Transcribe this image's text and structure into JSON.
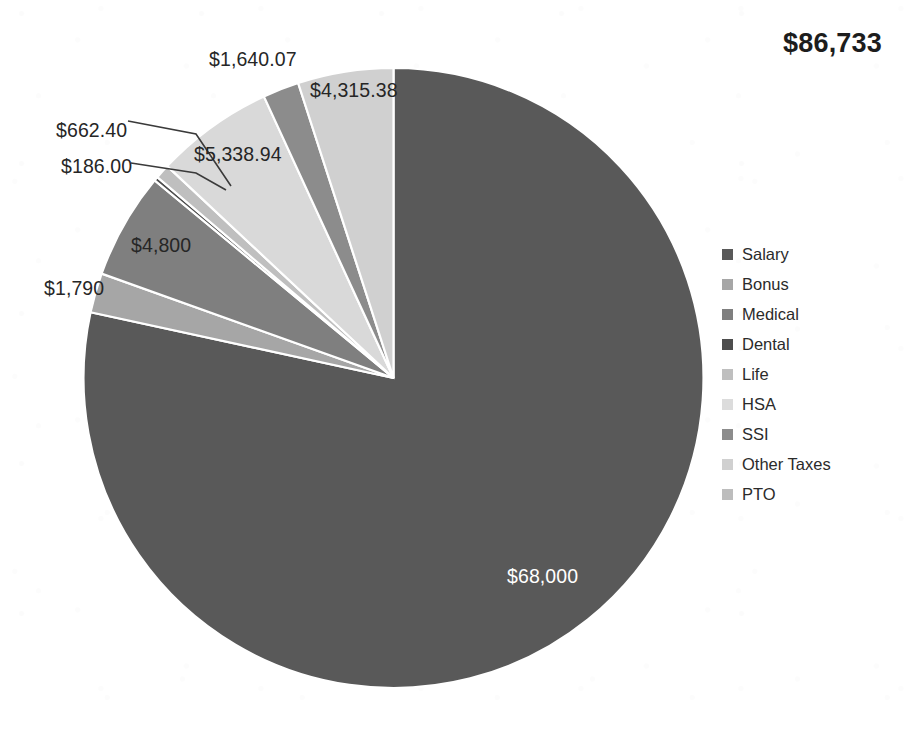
{
  "total": {
    "label": "$86,733"
  },
  "chart_data": {
    "type": "pie",
    "title": "",
    "total": 86733,
    "total_label": "$86,733",
    "legend_position": "right",
    "grid": false,
    "start_angle_deg": 0,
    "direction": "clockwise",
    "categories": [
      "Salary",
      "Bonus",
      "Medical",
      "Dental",
      "Life",
      "HSA",
      "SSI",
      "Other Taxes",
      "PTO"
    ],
    "values": [
      68000,
      1790,
      4800,
      186.0,
      662.4,
      5338.94,
      1640.07,
      4315.38,
      0
    ],
    "slices": [
      {
        "name": "Salary",
        "label": "$68,000",
        "value": 68000,
        "color": "#595959",
        "label_color": "#ffffff",
        "leader": false
      },
      {
        "name": "Bonus",
        "label": "$1,790",
        "value": 1790,
        "color": "#a6a6a6",
        "label_color": "#262626",
        "leader": false
      },
      {
        "name": "Medical",
        "label": "$4,800",
        "value": 4800,
        "color": "#7f7f7f",
        "label_color": "#262626",
        "leader": false
      },
      {
        "name": "Dental",
        "label": "$186.00",
        "value": 186.0,
        "color": "#4d4d4d",
        "label_color": "#262626",
        "leader": true
      },
      {
        "name": "Life",
        "label": "$662.40",
        "value": 662.4,
        "color": "#bfbfbf",
        "label_color": "#262626",
        "leader": true
      },
      {
        "name": "HSA",
        "label": "$5,338.94",
        "value": 5338.94,
        "color": "#d9d9d9",
        "label_color": "#262626",
        "leader": false
      },
      {
        "name": "SSI",
        "label": "$1,640.07",
        "value": 1640.07,
        "color": "#8c8c8c",
        "label_color": "#262626",
        "leader": false
      },
      {
        "name": "Other Taxes",
        "label": "$4,315.38",
        "value": 4315.38,
        "color": "#d0d0d0",
        "label_color": "#262626",
        "leader": false
      },
      {
        "name": "PTO",
        "label": "",
        "value": 0,
        "color": "#bdbdbd",
        "label_color": "#262626",
        "leader": false
      }
    ],
    "data_labels": [
      {
        "text": "$1,640.07",
        "x": 209,
        "y": 48,
        "color": "dark"
      },
      {
        "text": "$4,315.38",
        "x": 310,
        "y": 79,
        "color": "dark"
      },
      {
        "text": "$662.40",
        "x": 56,
        "y": 119,
        "color": "dark"
      },
      {
        "text": "$5,338.94",
        "x": 194,
        "y": 143,
        "color": "dark"
      },
      {
        "text": "$186.00",
        "x": 61,
        "y": 155,
        "color": "dark"
      },
      {
        "text": "$4,800",
        "x": 131,
        "y": 234,
        "color": "dark"
      },
      {
        "text": "$1,790",
        "x": 44,
        "y": 277,
        "color": "dark"
      },
      {
        "text": "$68,000",
        "x": 507,
        "y": 565,
        "color": "white"
      }
    ]
  },
  "legend": {
    "items": [
      {
        "label": "Salary",
        "color": "#595959"
      },
      {
        "label": "Bonus",
        "color": "#a6a6a6"
      },
      {
        "label": "Medical",
        "color": "#7f7f7f"
      },
      {
        "label": "Dental",
        "color": "#4d4d4d"
      },
      {
        "label": "Life",
        "color": "#bfbfbf"
      },
      {
        "label": "HSA",
        "color": "#dcdcdc"
      },
      {
        "label": "SSI",
        "color": "#8c8c8c"
      },
      {
        "label": "Other Taxes",
        "color": "#d0d0d0"
      },
      {
        "label": "PTO",
        "color": "#bdbdbd"
      }
    ]
  }
}
